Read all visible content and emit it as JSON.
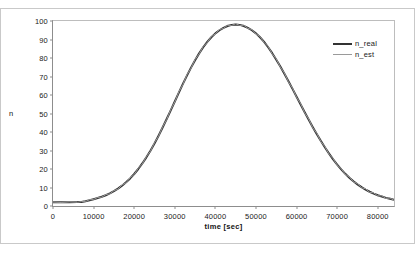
{
  "chart_data": {
    "type": "line",
    "title": "",
    "xlabel": "time [sec]",
    "ylabel": "n",
    "xlim": [
      0,
      84000
    ],
    "ylim": [
      0,
      100
    ],
    "grid": false,
    "legend_position": "right",
    "xticks": [
      0,
      10000,
      20000,
      30000,
      40000,
      50000,
      60000,
      70000,
      80000
    ],
    "xtick_labels": [
      "0",
      "10000",
      "20000",
      "30000",
      "40000",
      "50000",
      "60000",
      "70000",
      "80000"
    ],
    "yticks": [
      0,
      10,
      20,
      30,
      40,
      50,
      60,
      70,
      80,
      90,
      100
    ],
    "ytick_labels": [
      "0",
      "10",
      "20",
      "30",
      "40",
      "50",
      "60",
      "70",
      "80",
      "90",
      "100"
    ],
    "x": [
      0,
      2000,
      4000,
      6000,
      7000,
      8000,
      9000,
      10000,
      11000,
      12000,
      13000,
      14000,
      15000,
      16000,
      17000,
      18000,
      19000,
      20000,
      21000,
      22000,
      23000,
      24000,
      25000,
      26000,
      27000,
      28000,
      29000,
      30000,
      31000,
      32000,
      33000,
      34000,
      35000,
      36000,
      37000,
      38000,
      39000,
      40000,
      41000,
      42000,
      43000,
      44000,
      45000,
      46000,
      47000,
      48000,
      49000,
      50000,
      51000,
      52000,
      53000,
      54000,
      55000,
      56000,
      57000,
      58000,
      59000,
      60000,
      61000,
      62000,
      63000,
      64000,
      65000,
      66000,
      67000,
      68000,
      69000,
      70000,
      71000,
      72000,
      73000,
      74000,
      75000,
      76000,
      77000,
      78000,
      79000,
      80000,
      81000,
      82000,
      83000,
      84000
    ],
    "series": [
      {
        "name": "n_real",
        "color": "#333333",
        "width": 2.0,
        "values": [
          2.0,
          2.0,
          2.0,
          2.1,
          2.2,
          2.6,
          3.1,
          3.7,
          4.3,
          5.0,
          5.8,
          6.8,
          8.0,
          9.4,
          11.0,
          12.8,
          14.9,
          17.3,
          20.0,
          23.0,
          26.3,
          29.9,
          33.8,
          38.0,
          42.4,
          47.0,
          51.7,
          56.5,
          61.3,
          66.0,
          70.5,
          74.8,
          78.8,
          82.5,
          85.8,
          88.7,
          91.2,
          93.3,
          95.0,
          96.3,
          97.3,
          97.9,
          98.1,
          97.9,
          97.3,
          96.3,
          95.0,
          93.3,
          91.2,
          88.7,
          85.8,
          82.6,
          79.1,
          75.4,
          71.5,
          67.4,
          63.3,
          59.1,
          54.9,
          50.7,
          46.6,
          42.6,
          38.8,
          35.1,
          31.6,
          28.3,
          25.2,
          22.4,
          19.8,
          17.4,
          15.3,
          13.4,
          11.7,
          10.2,
          8.9,
          7.7,
          6.7,
          5.8,
          5.1,
          4.4,
          3.9,
          3.4
        ]
      },
      {
        "name": "n_est",
        "color": "#9a9a9a",
        "width": 1.0,
        "values": [
          2.1,
          1.9,
          2.2,
          2.0,
          2.4,
          2.4,
          3.4,
          3.5,
          4.6,
          4.8,
          6.1,
          6.6,
          8.3,
          9.1,
          11.4,
          12.5,
          15.3,
          17.0,
          20.4,
          22.7,
          26.7,
          29.6,
          34.2,
          37.7,
          42.8,
          46.7,
          52.1,
          56.2,
          61.7,
          65.7,
          70.9,
          74.5,
          79.2,
          82.2,
          86.2,
          88.4,
          91.6,
          93.0,
          95.4,
          96.0,
          97.7,
          97.6,
          98.5,
          97.6,
          97.7,
          96.0,
          95.4,
          93.0,
          91.6,
          88.4,
          86.2,
          82.3,
          79.5,
          75.1,
          71.9,
          67.1,
          63.7,
          58.8,
          55.3,
          50.4,
          47.0,
          42.3,
          39.2,
          34.8,
          32.0,
          28.0,
          25.6,
          22.1,
          20.2,
          17.1,
          15.7,
          13.1,
          12.1,
          9.9,
          9.3,
          7.4,
          7.1,
          5.5,
          5.5,
          4.1,
          4.3,
          3.1
        ]
      }
    ],
    "legend_entries": [
      {
        "label": "n_real",
        "color": "#333333",
        "width": 2.0
      },
      {
        "label": "n_est",
        "color": "#9a9a9a",
        "width": 1.0
      }
    ]
  }
}
